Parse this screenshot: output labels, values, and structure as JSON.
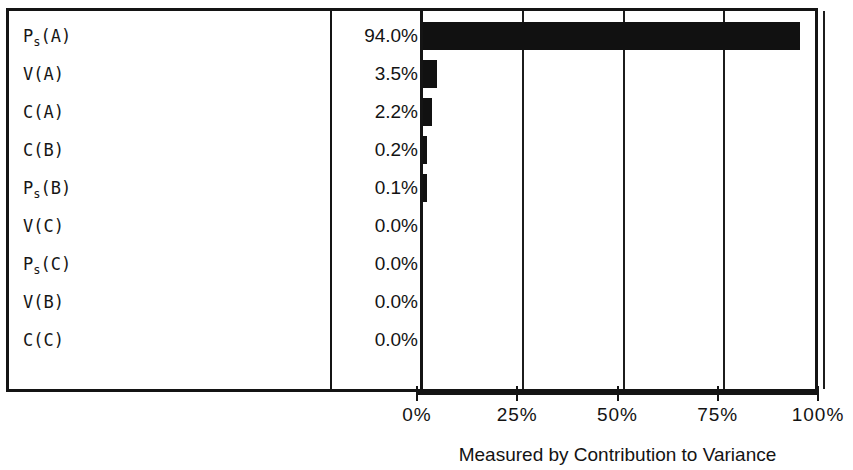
{
  "chart_data": {
    "type": "bar",
    "orientation": "horizontal",
    "title": "",
    "xlabel": "Measured by Contribution to Variance",
    "ylabel": "",
    "xlim": [
      0,
      100
    ],
    "grid": true,
    "legend": false,
    "tick_labels": [
      "0%",
      "25%",
      "50%",
      "75%",
      "100%"
    ],
    "tick_values": [
      0,
      25,
      50,
      75,
      100
    ],
    "categories": [
      "Ps(A)",
      "V(A)",
      "C(A)",
      "C(B)",
      "Ps(B)",
      "V(C)",
      "Ps(C)",
      "V(B)",
      "C(C)"
    ],
    "values": [
      94.0,
      3.5,
      2.2,
      0.2,
      0.1,
      0.0,
      0.0,
      0.0,
      0.0
    ],
    "value_labels": [
      "94.0%",
      "3.5%",
      "2.2%",
      "0.2%",
      "0.1%",
      "0.0%",
      "0.0%",
      "0.0%",
      "0.0%"
    ],
    "rows": [
      {
        "base": "P",
        "sub": "s",
        "suffix": "(A)",
        "value": 94.0,
        "value_label": "94.0%"
      },
      {
        "base": "V",
        "sub": "",
        "suffix": "(A)",
        "value": 3.5,
        "value_label": "3.5%"
      },
      {
        "base": "C",
        "sub": "",
        "suffix": "(A)",
        "value": 2.2,
        "value_label": "2.2%"
      },
      {
        "base": "C",
        "sub": "",
        "suffix": "(B)",
        "value": 0.2,
        "value_label": "0.2%"
      },
      {
        "base": "P",
        "sub": "s",
        "suffix": "(B)",
        "value": 0.1,
        "value_label": "0.1%"
      },
      {
        "base": "V",
        "sub": "",
        "suffix": "(C)",
        "value": 0.0,
        "value_label": "0.0%"
      },
      {
        "base": "P",
        "sub": "s",
        "suffix": "(C)",
        "value": 0.0,
        "value_label": "0.0%"
      },
      {
        "base": "V",
        "sub": "",
        "suffix": "(B)",
        "value": 0.0,
        "value_label": "0.0%"
      },
      {
        "base": "C",
        "sub": "",
        "suffix": "(C)",
        "value": 0.0,
        "value_label": "0.0%"
      }
    ],
    "bar_color": "#111111",
    "axis_color": "#141414",
    "background_color": "#ffffff"
  }
}
